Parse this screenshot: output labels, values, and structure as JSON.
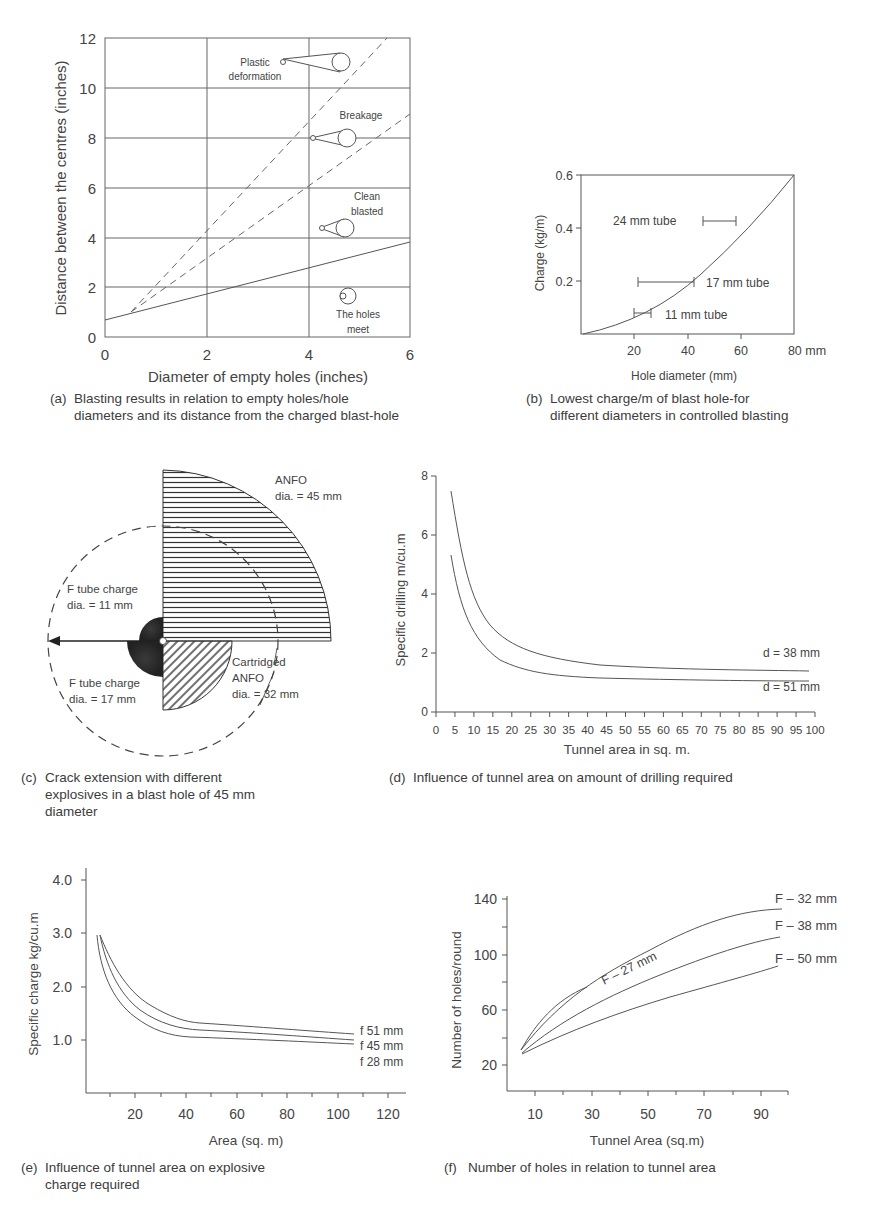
{
  "chart_data": [
    {
      "id": "a",
      "type": "line",
      "title": "",
      "caption": "(a) Blasting results in relation to empty holes/hole diameters and its distance from the charged blast-hole",
      "xlabel": "Diameter of empty holes (inches)",
      "ylabel": "Distance between the centres (inches)",
      "xlim": [
        0,
        6
      ],
      "ylim": [
        0,
        12
      ],
      "xticks": [
        "0",
        "2",
        "4",
        "6"
      ],
      "yticks": [
        "0",
        "2",
        "4",
        "6",
        "8",
        "10",
        "12"
      ],
      "grid": true,
      "series": [
        {
          "name": "Plastic deformation / Breakage boundary",
          "style": "dashed",
          "x": [
            0.5,
            5.5
          ],
          "y": [
            1.0,
            12.0
          ]
        },
        {
          "name": "Breakage / Clean blasted boundary",
          "style": "dashed",
          "x": [
            0.5,
            6.0
          ],
          "y": [
            1.0,
            9.0
          ]
        },
        {
          "name": "Clean blasted / The holes meet boundary",
          "style": "solid",
          "x": [
            0.0,
            6.0
          ],
          "y": [
            0.7,
            3.8
          ]
        }
      ],
      "annotations": [
        {
          "text": "Plastic deformation",
          "region": "top"
        },
        {
          "text": "Breakage",
          "region": "upper-middle"
        },
        {
          "text": "Clean blasted",
          "region": "lower-middle"
        },
        {
          "text": "The holes meet",
          "region": "bottom"
        }
      ]
    },
    {
      "id": "b",
      "type": "line",
      "caption": "(b) Lowest charge/m of blast hole-for different diameters in controlled blasting",
      "xlabel": "Hole diameter (mm)",
      "ylabel": "Charge (kg/m)",
      "xlim": [
        0,
        80
      ],
      "ylim": [
        0,
        0.6
      ],
      "xticks": [
        "20",
        "40",
        "60",
        "80 mm"
      ],
      "yticks": [
        "0.2",
        "0.4",
        "0.6"
      ],
      "grid": false,
      "series": [
        {
          "name": "Lowest charge",
          "x": [
            0,
            10,
            20,
            30,
            40,
            50,
            60,
            70,
            80
          ],
          "y": [
            0,
            0.03,
            0.07,
            0.13,
            0.19,
            0.26,
            0.34,
            0.45,
            0.6
          ]
        }
      ],
      "ranges": [
        {
          "label": "24 mm tube",
          "x_from": 46,
          "x_to": 58,
          "y": 0.43
        },
        {
          "label": "17 mm tube",
          "x_from": 21,
          "x_to": 42,
          "y": 0.2
        },
        {
          "label": "11 mm tube",
          "x_from": 19,
          "x_to": 26,
          "y": 0.08
        }
      ]
    },
    {
      "id": "d",
      "type": "line",
      "caption": "(d) Influence of tunnel area on amount of drilling required",
      "xlabel": "Tunnel area in sq. m.",
      "ylabel": "Specific drilling m/cu.m",
      "xlim": [
        0,
        100
      ],
      "ylim": [
        0,
        8
      ],
      "xticks": [
        "0",
        "5",
        "10",
        "15",
        "20",
        "25",
        "30",
        "35",
        "40",
        "45",
        "50",
        "55",
        "60",
        "65",
        "70",
        "75",
        "80",
        "85",
        "90",
        "95",
        "100"
      ],
      "yticks": [
        "0",
        "2",
        "4",
        "6",
        "8"
      ],
      "grid": false,
      "x": [
        4,
        8,
        12,
        16,
        20,
        25,
        30,
        40,
        50,
        60,
        70,
        80,
        90,
        98
      ],
      "series": [
        {
          "name": "d = 38 mm",
          "values": [
            7.5,
            5.4,
            3.9,
            3.0,
            2.5,
            2.15,
            1.95,
            1.75,
            1.68,
            1.62,
            1.58,
            1.57,
            1.56,
            1.55
          ]
        },
        {
          "name": "d = 51 mm",
          "values": [
            5.3,
            3.6,
            2.6,
            2.05,
            1.75,
            1.5,
            1.38,
            1.28,
            1.24,
            1.22,
            1.21,
            1.2,
            1.2,
            1.2
          ]
        }
      ]
    },
    {
      "id": "e",
      "type": "line",
      "caption": "(e) Influence of tunnel area on explosive charge required",
      "xlabel": "Area (sq. m)",
      "ylabel": "Specific charge kg/cu.m",
      "xlim": [
        0,
        125
      ],
      "ylim": [
        0,
        4.2
      ],
      "xticks": [
        "20",
        "40",
        "60",
        "80",
        "100",
        "120"
      ],
      "yticks": [
        "1.0",
        "2.0",
        "3.0",
        "4.0"
      ],
      "grid": false,
      "x": [
        5,
        10,
        15,
        20,
        25,
        30,
        35,
        40,
        50,
        60,
        70,
        80,
        90,
        100,
        106
      ],
      "series": [
        {
          "name": "f 51 mm",
          "values": [
            2.95,
            2.5,
            2.1,
            1.8,
            1.58,
            1.45,
            1.37,
            1.32,
            1.29,
            1.26,
            1.23,
            1.2,
            1.17,
            1.13,
            1.11
          ]
        },
        {
          "name": "f 45 mm",
          "values": [
            2.95,
            2.3,
            1.9,
            1.6,
            1.42,
            1.3,
            1.23,
            1.2,
            1.17,
            1.14,
            1.11,
            1.08,
            1.05,
            1.02,
            1.0
          ]
        },
        {
          "name": "f 28 mm",
          "values": [
            2.95,
            2.1,
            1.7,
            1.42,
            1.26,
            1.15,
            1.08,
            1.05,
            1.03,
            1.01,
            0.99,
            0.97,
            0.95,
            0.93,
            0.92
          ]
        }
      ]
    },
    {
      "id": "f",
      "type": "line",
      "caption": "(f) Number of holes in relation to tunnel area",
      "xlabel": "Tunnel Area (sq.m)",
      "ylabel": "Number of holes/round",
      "xlim": [
        0,
        100
      ],
      "ylim": [
        0,
        145
      ],
      "xticks": [
        "10",
        "30",
        "50",
        "70",
        "90"
      ],
      "yticks": [
        "20",
        "60",
        "100",
        "140"
      ],
      "grid": false,
      "series": [
        {
          "name": "F – 27 mm",
          "x": [
            5,
            10,
            15,
            20,
            25,
            28
          ],
          "y": [
            30,
            45,
            56,
            65,
            72,
            76
          ]
        },
        {
          "name": "F – 32 mm",
          "x": [
            5,
            10,
            20,
            30,
            40,
            50,
            60,
            70,
            80,
            90,
            96
          ],
          "y": [
            29,
            40,
            55,
            67,
            78,
            88,
            98,
            108,
            116,
            125,
            130
          ]
        },
        {
          "name": "F – 38 mm",
          "x": [
            5,
            10,
            20,
            30,
            40,
            50,
            60,
            70,
            80,
            90,
            96
          ],
          "y": [
            28,
            37,
            49,
            59,
            68,
            77,
            85,
            93,
            100,
            107,
            111
          ]
        },
        {
          "name": "F – 50 mm",
          "x": [
            5,
            10,
            20,
            30,
            40,
            50,
            60,
            70,
            80,
            90,
            96
          ],
          "y": [
            27,
            34,
            42,
            49,
            56,
            62,
            68,
            74,
            79,
            85,
            89
          ]
        }
      ]
    }
  ],
  "diagram_c": {
    "caption": "(c) Crack extension with different explosives in a blast hole of 45 mm diameter",
    "labels": {
      "anfo_line1": "ANFO",
      "anfo_line2": "dia. = 45 mm",
      "ftube11_line1": "F tube charge",
      "ftube11_line2": "dia. = 11 mm",
      "ftube17_line1": "F tube charge",
      "ftube17_line2": "dia. = 17 mm",
      "cart_line1": "Cartridged",
      "cart_line2": "ANFO",
      "cart_line3": "dia. = 32 mm"
    }
  },
  "captions": {
    "a_line1": "Blasting results in relation to empty holes/hole",
    "a_line2": "diameters and its distance from the charged blast-hole",
    "a_tag": "(a)",
    "b_line1": "Lowest charge/m of blast hole-for",
    "b_line2": "different diameters in controlled blasting",
    "b_tag": "(b)",
    "c_line1": "Crack extension with different",
    "c_line2": "explosives in a blast hole of 45 mm",
    "c_line3": "diameter",
    "c_tag": "(c)",
    "d_line1": "Influence of tunnel area on amount of drilling required",
    "d_tag": "(d)",
    "e_line1": "Influence of tunnel area on explosive",
    "e_line2": "charge required",
    "e_tag": "(e)",
    "f_line1": "Number of holes in relation to tunnel area",
    "f_tag": "(f)"
  },
  "labels": {
    "a": {
      "ylabel": "Distance between the centres (inches)",
      "xlabel": "Diameter of empty holes (inches)",
      "x0": "0",
      "x2": "2",
      "x4": "4",
      "x6": "6",
      "y0": "0",
      "y2": "2",
      "y4": "4",
      "y6": "6",
      "y8": "8",
      "y10": "10",
      "y12": "12",
      "plastic1": "Plastic",
      "plastic2": "deformation",
      "breakage": "Breakage",
      "clean1": "Clean",
      "clean2": "blasted",
      "meet1": "The holes",
      "meet2": "meet"
    },
    "b": {
      "ylabel": "Charge (kg/m)",
      "xlabel": "Hole diameter (mm)",
      "y06": "0.6",
      "y04": "0.4",
      "y02": "0.2",
      "x20": "20",
      "x40": "40",
      "x60": "60",
      "x80": "80 mm",
      "t24": "24 mm tube",
      "t17": "17 mm tube",
      "t11": "11 mm tube"
    },
    "d": {
      "ylabel": "Specific drilling m/cu.m",
      "xlabel": "Tunnel area in sq. m.",
      "y0": "0",
      "y2": "2",
      "y4": "4",
      "y6": "6",
      "y8": "8",
      "s38": "d = 38 mm",
      "s51": "d = 51 mm"
    },
    "e": {
      "ylabel": "Specific charge kg/cu.m",
      "xlabel": "Area (sq. m)",
      "y1": "1.0",
      "y2": "2.0",
      "y3": "3.0",
      "y4": "4.0",
      "x20": "20",
      "x40": "40",
      "x60": "60",
      "x80": "80",
      "x100": "100",
      "x120": "120",
      "s51": "f 51 mm",
      "s45": "f 45 mm",
      "s28": "f 28 mm"
    },
    "f": {
      "ylabel": "Number of holes/round",
      "xlabel": "Tunnel Area (sq.m)",
      "y20": "20",
      "y60": "60",
      "y100": "100",
      "y140": "140",
      "x10": "10",
      "x30": "30",
      "x50": "50",
      "x70": "70",
      "x90": "90",
      "s27": "F – 27 mm",
      "s32": "F – 32 mm",
      "s38": "F – 38 mm",
      "s50": "F – 50 mm"
    }
  }
}
